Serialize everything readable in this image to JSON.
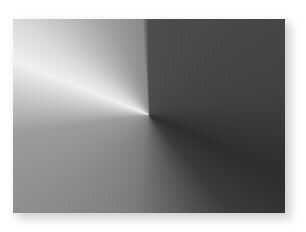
{
  "image": {
    "description": "Brushed-metal style conic gradient panel with drop shadow",
    "panel": {
      "x": 13,
      "y": 19,
      "width": 272,
      "height": 194,
      "center": {
        "x": 149,
        "y": 115
      }
    },
    "colors": {
      "background": "#ffffff",
      "top": "#4c4c4c",
      "right": "#404040",
      "lower_right_darkest": "#2c2c2c",
      "bottom": "#7c7c7c",
      "left": "#9c9c9c",
      "highlight_upper_left": "#f2f2f2",
      "upper_left_fade": "#9a9a9a"
    }
  }
}
